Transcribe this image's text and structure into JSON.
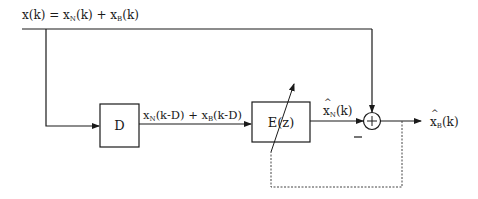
{
  "diagram": {
    "type": "block-diagram",
    "input_label": {
      "base": "x(k) = x",
      "sub1": "N",
      "mid": "(k) + x",
      "sub2": "B",
      "tail": "(k)"
    },
    "delay_block": {
      "label": "D"
    },
    "delayed_signal_label": {
      "base": "x",
      "sub1": "N",
      "mid": "(k-D) + x",
      "sub2": "B",
      "tail": "(k-D)"
    },
    "adaptive_filter_block": {
      "label": "E(z)"
    },
    "estimate_label": {
      "base": "x",
      "sub": "N",
      "tail": "(k)"
    },
    "summing_junction": {
      "symbol": "+",
      "minus_sign": "—"
    },
    "output_label": {
      "base": "x",
      "sub": "B",
      "tail": "(k)"
    },
    "feedback": {
      "style": "dashed"
    },
    "colors": {
      "line": "#1a1a1a",
      "background": "#ffffff"
    }
  }
}
